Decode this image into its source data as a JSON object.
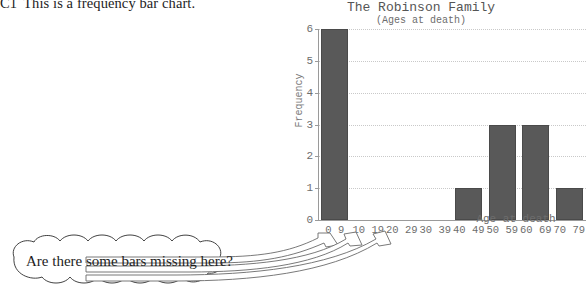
{
  "question": {
    "code": "C1",
    "text": "This is a frequency bar chart."
  },
  "annotation": {
    "bubble_text": "Are there some bars missing here?",
    "arrow_count": 3
  },
  "chart_data": {
    "type": "bar",
    "title": "The Robinson Family",
    "subtitle": "(Ages at death)",
    "xlabel": "Age at death",
    "ylabel": "Frequency",
    "categories": [
      "0 9",
      "10 19",
      "20 29",
      "30 39",
      "40 49",
      "50 59",
      "60 69",
      "70 79"
    ],
    "values": [
      6,
      0,
      0,
      0,
      1,
      3,
      3,
      1
    ],
    "ylim": [
      0,
      6
    ],
    "yticks": [
      0,
      1,
      2,
      3,
      4,
      5,
      6
    ],
    "grid": true,
    "legend": "none",
    "bar_color": "#595959",
    "grid_color": "#c9c9c9",
    "axis_color": "#9a9a9a",
    "missing_bars": [
      "10 19",
      "20 29",
      "30 39"
    ]
  }
}
